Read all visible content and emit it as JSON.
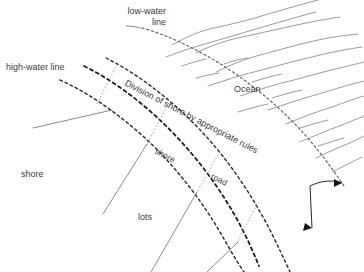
{
  "diagram": {
    "title": "Division of shore by appropriate rules",
    "background_color": "#ffffff",
    "ink_color": "#3b3b3b",
    "water_color": "#8a8a8a",
    "labels": {
      "low_water_line": "low-water\nline",
      "high_water_line": "high-water line",
      "ocean": "Ocean",
      "shore_zone": "shore",
      "lots": "lots",
      "division_rule": "Division of shore by appropriate rules",
      "band_shore": "shore",
      "band_road": "road"
    },
    "features": {
      "high_water_line_style": "bold-dashed",
      "low_water_line_style": "fine-dotted",
      "band_divider_style": "dashed",
      "lot_line_style": "thin-solid",
      "leader_style": "solid-with-arrowheads",
      "arrow_count": 2
    }
  }
}
